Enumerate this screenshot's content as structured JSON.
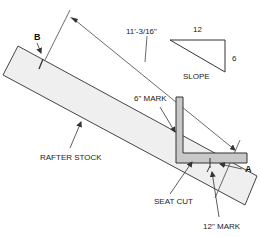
{
  "diagram": {
    "labels": {
      "point_b": "B",
      "point_a": "A",
      "length": "11'-3/16\"",
      "slope_rise": "6",
      "slope_run": "12",
      "slope": "SLOPE",
      "six_inch_mark": "6\" MARK",
      "rafter_stock": "RAFTER STOCK",
      "seat_cut": "SEAT CUT",
      "twelve_inch_mark": "12\" MARK"
    },
    "colors": {
      "line": "#333333",
      "stock_fill": "#efefef",
      "square_fill": "#c8c8c8"
    }
  }
}
